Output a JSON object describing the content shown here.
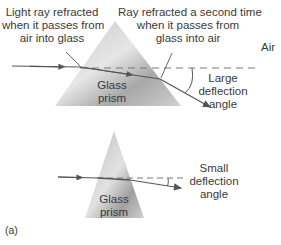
{
  "labels": {
    "entry_refraction": [
      "Light ray refracted",
      "when it passes from",
      "air into glass"
    ],
    "exit_refraction": [
      "Ray refracted a second time",
      "when it passes from",
      "glass into air"
    ],
    "air": "Air",
    "large_prism": [
      "Glass",
      "prism"
    ],
    "large_angle": [
      "Large",
      "deflection",
      "angle"
    ],
    "small_prism": [
      "Glass",
      "prism"
    ],
    "small_angle": [
      "Small",
      "deflection",
      "angle"
    ],
    "panel": "(a)"
  },
  "colors": {
    "ray": "#555555",
    "dashed": "#777777",
    "prism_light": "#d9d9d9",
    "prism_dark": "#9a9a9a"
  }
}
